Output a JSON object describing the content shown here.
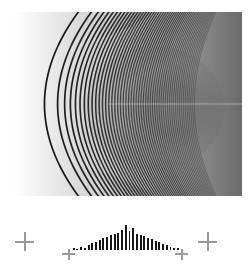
{
  "figure": {
    "background_color": "#ffffff",
    "width_px": 252,
    "height_px": 267
  },
  "fringe_panel": {
    "name": "hyperbolic-chirp-fringe-pattern",
    "description": "High-frequency black and white hyperbolic interference fringes that aliase into flat gray moire toward the right",
    "panel_left_px": 13,
    "panel_top_px": 12,
    "panel_width_px": 229,
    "panel_height_px": 184,
    "fringe_color_dark": "#111111",
    "fringe_color_light": "#ffffff",
    "aliased_gray": "#5e5e5e",
    "clear_region_color": "#ffffff",
    "vertex_x_px": 30,
    "vertex_y_px": 92,
    "fringe_count": 52
  },
  "chart_data": {
    "type": "bar",
    "title": "",
    "subtitle": "",
    "xlabel": "",
    "ylabel": "",
    "grid": false,
    "legend": null,
    "bar_color": "#151515",
    "axis_color": "#9a9a9a",
    "marker_color": "#9a9a9a",
    "ylim": [
      0,
      1
    ],
    "categories": [
      "-14",
      "-13",
      "-12",
      "-11",
      "-10",
      "-9",
      "-8",
      "-7",
      "-6",
      "-5",
      "-4",
      "-3",
      "-2",
      "-1",
      "0",
      "1",
      "2",
      "3",
      "4",
      "5",
      "6",
      "7",
      "8",
      "9",
      "10",
      "11",
      "12",
      "13",
      "14"
    ],
    "values": [
      0.06,
      0.05,
      0.13,
      0.07,
      0.2,
      0.26,
      0.32,
      0.37,
      0.46,
      0.51,
      0.57,
      0.63,
      0.66,
      0.78,
      0.98,
      0.74,
      0.86,
      0.62,
      0.56,
      0.54,
      0.45,
      0.41,
      0.35,
      0.3,
      0.22,
      0.18,
      0.1,
      0.08,
      0.07
    ],
    "center_index": 14,
    "center_tick_value": "0"
  },
  "markers": {
    "name": "fiducial-crosses",
    "glyph": "+",
    "color": "#9a9a9a",
    "positions": [
      {
        "label": "left-fiducial-cross",
        "x_px": 24,
        "y_px": 232
      },
      {
        "label": "center-baseline-tick",
        "x_px": 125,
        "y_px": 226
      },
      {
        "label": "right-fiducial-cross",
        "x_px": 207,
        "y_px": 232
      }
    ]
  },
  "axis_endcaps": [
    {
      "label": "left-axis-endcap",
      "x_px": 66
    },
    {
      "label": "right-axis-endcap",
      "x_px": 168
    }
  ]
}
